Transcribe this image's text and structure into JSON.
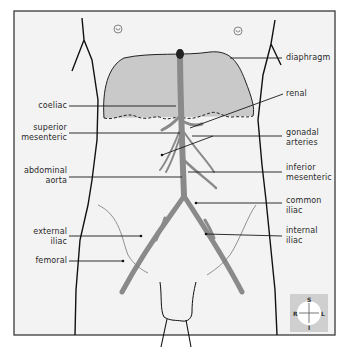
{
  "diagram": {
    "colors": {
      "background": "#f2f2f2",
      "border": "#3a3a3a",
      "diaphragm_fill": "#c8c8c8",
      "artery": "#8a8a8a",
      "label_text": "#2a2a2a",
      "compass_bg": "#cfcfcf"
    },
    "labels_left": [
      {
        "id": "coeliac",
        "lines": [
          "coeliac"
        ]
      },
      {
        "id": "superior-mesenteric",
        "lines": [
          "superior",
          "mesenteric"
        ]
      },
      {
        "id": "abdominal-aorta",
        "lines": [
          "abdominal",
          "aorta"
        ]
      },
      {
        "id": "external-iliac",
        "lines": [
          "external",
          "iliac"
        ]
      },
      {
        "id": "femoral",
        "lines": [
          "femoral"
        ]
      }
    ],
    "labels_right": [
      {
        "id": "diaphragm",
        "lines": [
          "diaphragm"
        ]
      },
      {
        "id": "renal",
        "lines": [
          "renal"
        ]
      },
      {
        "id": "gonadal-arteries",
        "lines": [
          "gonadal",
          "arteries"
        ]
      },
      {
        "id": "inferior-mesenteric",
        "lines": [
          "inferior",
          "mesenteric"
        ]
      },
      {
        "id": "common-iliac",
        "lines": [
          "common",
          "iliac"
        ]
      },
      {
        "id": "internal-iliac",
        "lines": [
          "internal",
          "iliac"
        ]
      }
    ],
    "compass": {
      "top": "S",
      "bottom": "I",
      "left": "R",
      "right": "L"
    }
  }
}
